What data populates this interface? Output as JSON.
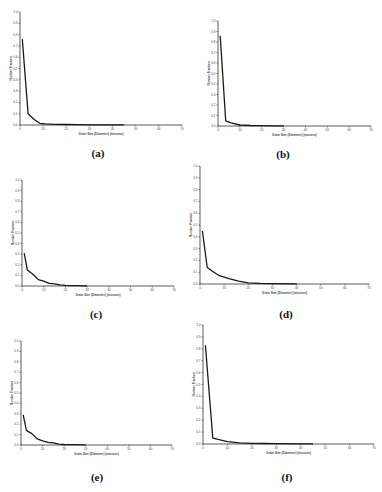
{
  "figure": {
    "panel_labels": [
      "(a)",
      "(b)",
      "(c)",
      "(d)",
      "(e)",
      "(f)"
    ]
  },
  "chart_data": [
    {
      "panel": "(a)",
      "type": "line",
      "xlabel": "Grain Size (Diameter) (microns)",
      "ylabel": "Number Fraction",
      "xlim": [
        0,
        70
      ],
      "ylim": [
        0,
        1.0
      ],
      "xticks": [
        0,
        10,
        20,
        30,
        40,
        50,
        60,
        70
      ],
      "yticks": [
        0.0,
        0.1,
        0.2,
        0.3,
        0.4,
        0.5,
        0.6,
        0.7,
        0.8,
        0.9,
        1.0
      ],
      "grid": false,
      "x": [
        1,
        3.5,
        6,
        8.5,
        11,
        15,
        20,
        25,
        30,
        40,
        45
      ],
      "values": [
        0.76,
        0.1,
        0.05,
        0.015,
        0.01,
        0.006,
        0.004,
        0.003,
        0.002,
        0.001,
        0.001
      ]
    },
    {
      "panel": "(b)",
      "type": "line",
      "xlabel": "Grain Size (Diameter) (microns)",
      "ylabel": "Number Fraction",
      "xlim": [
        0,
        70
      ],
      "ylim": [
        0,
        1.0
      ],
      "xticks": [
        0,
        10,
        20,
        30,
        40,
        50,
        60,
        70
      ],
      "yticks": [
        0.0,
        0.1,
        0.2,
        0.3,
        0.4,
        0.5,
        0.6,
        0.7,
        0.8,
        0.9,
        1.0
      ],
      "grid": false,
      "x": [
        1,
        3.5,
        6,
        10,
        15,
        20,
        25,
        30
      ],
      "values": [
        0.86,
        0.05,
        0.03,
        0.01,
        0.005,
        0.003,
        0.002,
        0.001
      ]
    },
    {
      "panel": "(c)",
      "type": "line",
      "xlabel": "Grain Size (Diameter) (microns)",
      "ylabel": "Number Fraction",
      "xlim": [
        0,
        70
      ],
      "ylim": [
        0,
        1.0
      ],
      "xticks": [
        0,
        10,
        20,
        30,
        40,
        50,
        60,
        70
      ],
      "yticks": [
        0.0,
        0.1,
        0.2,
        0.3,
        0.4,
        0.5,
        0.6,
        0.7,
        0.8,
        0.9,
        1.0
      ],
      "grid": false,
      "x": [
        1,
        2.5,
        5,
        7.5,
        10,
        12.5,
        15,
        17.5,
        20,
        25,
        30
      ],
      "values": [
        0.31,
        0.15,
        0.11,
        0.06,
        0.045,
        0.025,
        0.02,
        0.01,
        0.006,
        0.003,
        0.002
      ]
    },
    {
      "panel": "(d)",
      "type": "line",
      "xlabel": "Grain Size (Diameter) (microns)",
      "ylabel": "Number Fraction",
      "xlim": [
        0,
        70
      ],
      "ylim": [
        0,
        1.0
      ],
      "xticks": [
        0,
        10,
        20,
        30,
        40,
        50,
        60,
        70
      ],
      "yticks": [
        0.0,
        0.1,
        0.2,
        0.3,
        0.4,
        0.5,
        0.6,
        0.7,
        0.8,
        0.9,
        1.0
      ],
      "grid": false,
      "x": [
        1,
        3,
        5,
        8,
        12,
        16,
        20,
        25,
        30,
        40
      ],
      "values": [
        0.45,
        0.14,
        0.11,
        0.07,
        0.045,
        0.025,
        0.01,
        0.005,
        0.003,
        0.001
      ]
    },
    {
      "panel": "(e)",
      "type": "line",
      "xlabel": "Grain Size (Diameter) (microns)",
      "ylabel": "Number Fraction",
      "xlim": [
        0,
        70
      ],
      "ylim": [
        0,
        1.0
      ],
      "xticks": [
        0,
        10,
        20,
        30,
        40,
        50,
        60,
        70
      ],
      "yticks": [
        0.0,
        0.1,
        0.2,
        0.3,
        0.4,
        0.5,
        0.6,
        0.7,
        0.8,
        0.9,
        1.0
      ],
      "grid": false,
      "x": [
        1,
        2.5,
        5,
        7.5,
        10,
        12.5,
        15,
        17.5,
        20,
        25,
        30
      ],
      "values": [
        0.29,
        0.14,
        0.11,
        0.06,
        0.04,
        0.025,
        0.02,
        0.008,
        0.005,
        0.003,
        0.002
      ]
    },
    {
      "panel": "(f)",
      "type": "line",
      "xlabel": "Grain Size (Diameter) (microns)",
      "ylabel": "Number Fraction",
      "xlim": [
        0,
        70
      ],
      "ylim": [
        0,
        1.0
      ],
      "xticks": [
        0,
        10,
        20,
        30,
        40,
        50,
        60,
        70
      ],
      "yticks": [
        0.0,
        0.1,
        0.2,
        0.3,
        0.4,
        0.5,
        0.6,
        0.7,
        0.8,
        0.9,
        1.0
      ],
      "grid": false,
      "x": [
        1,
        4,
        10,
        15,
        20,
        25,
        30,
        40,
        45
      ],
      "values": [
        0.83,
        0.05,
        0.02,
        0.01,
        0.005,
        0.004,
        0.003,
        0.002,
        0.001
      ]
    }
  ]
}
